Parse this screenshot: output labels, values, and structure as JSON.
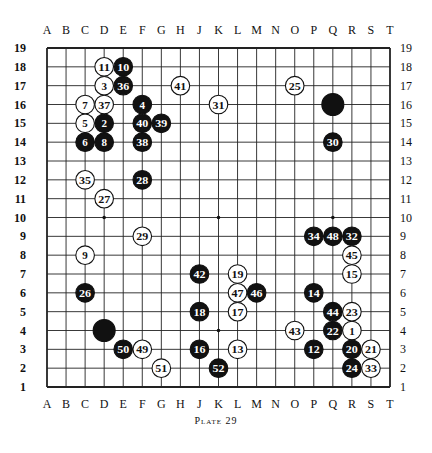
{
  "diagram": {
    "type": "go-board",
    "size": 19,
    "columns": [
      "A",
      "B",
      "C",
      "D",
      "E",
      "F",
      "G",
      "H",
      "J",
      "K",
      "L",
      "M",
      "N",
      "O",
      "P",
      "Q",
      "R",
      "S",
      "T"
    ],
    "rows": [
      19,
      18,
      17,
      16,
      15,
      14,
      13,
      12,
      11,
      10,
      9,
      8,
      7,
      6,
      5,
      4,
      3,
      2,
      1
    ],
    "hoshi": [
      "D4",
      "K4",
      "Q4",
      "D10",
      "K10",
      "Q10",
      "D16",
      "K16",
      "Q16"
    ],
    "caption": "Plate 29",
    "stones": [
      {
        "pt": "Q16",
        "color": "black",
        "label": ""
      },
      {
        "pt": "D4",
        "color": "black",
        "label": ""
      },
      {
        "pt": "R4",
        "color": "white",
        "label": "1"
      },
      {
        "pt": "D15",
        "color": "black",
        "label": "2"
      },
      {
        "pt": "D17",
        "color": "white",
        "label": "3"
      },
      {
        "pt": "F16",
        "color": "black",
        "label": "4"
      },
      {
        "pt": "C15",
        "color": "white",
        "label": "5"
      },
      {
        "pt": "C14",
        "color": "black",
        "label": "6"
      },
      {
        "pt": "C16",
        "color": "white",
        "label": "7"
      },
      {
        "pt": "D14",
        "color": "black",
        "label": "8"
      },
      {
        "pt": "C8",
        "color": "white",
        "label": "9"
      },
      {
        "pt": "E18",
        "color": "black",
        "label": "10"
      },
      {
        "pt": "D18",
        "color": "white",
        "label": "11"
      },
      {
        "pt": "P3",
        "color": "black",
        "label": "12"
      },
      {
        "pt": "L3",
        "color": "white",
        "label": "13"
      },
      {
        "pt": "P6",
        "color": "black",
        "label": "14"
      },
      {
        "pt": "R7",
        "color": "white",
        "label": "15"
      },
      {
        "pt": "J3",
        "color": "black",
        "label": "16"
      },
      {
        "pt": "L5",
        "color": "white",
        "label": "17"
      },
      {
        "pt": "J5",
        "color": "black",
        "label": "18"
      },
      {
        "pt": "L7",
        "color": "white",
        "label": "19"
      },
      {
        "pt": "R3",
        "color": "black",
        "label": "20"
      },
      {
        "pt": "S3",
        "color": "white",
        "label": "21"
      },
      {
        "pt": "Q4",
        "color": "black",
        "label": "22"
      },
      {
        "pt": "R5",
        "color": "white",
        "label": "23"
      },
      {
        "pt": "R2",
        "color": "black",
        "label": "24"
      },
      {
        "pt": "O17",
        "color": "white",
        "label": "25"
      },
      {
        "pt": "C6",
        "color": "black",
        "label": "26"
      },
      {
        "pt": "D11",
        "color": "white",
        "label": "27"
      },
      {
        "pt": "F12",
        "color": "black",
        "label": "28"
      },
      {
        "pt": "F9",
        "color": "white",
        "label": "29"
      },
      {
        "pt": "Q14",
        "color": "black",
        "label": "30"
      },
      {
        "pt": "K16",
        "color": "white",
        "label": "31"
      },
      {
        "pt": "R9",
        "color": "black",
        "label": "32"
      },
      {
        "pt": "S2",
        "color": "white",
        "label": "33"
      },
      {
        "pt": "P9",
        "color": "black",
        "label": "34"
      },
      {
        "pt": "C12",
        "color": "white",
        "label": "35"
      },
      {
        "pt": "E17",
        "color": "black",
        "label": "36"
      },
      {
        "pt": "D16",
        "color": "white",
        "label": "37"
      },
      {
        "pt": "F14",
        "color": "black",
        "label": "38"
      },
      {
        "pt": "G15",
        "color": "black",
        "label": "39"
      },
      {
        "pt": "F15",
        "color": "black",
        "label": "40"
      },
      {
        "pt": "H17",
        "color": "white",
        "label": "41"
      },
      {
        "pt": "J7",
        "color": "black",
        "label": "42"
      },
      {
        "pt": "O4",
        "color": "white",
        "label": "43"
      },
      {
        "pt": "Q5",
        "color": "black",
        "label": "44"
      },
      {
        "pt": "R8",
        "color": "white",
        "label": "45"
      },
      {
        "pt": "M6",
        "color": "black",
        "label": "46"
      },
      {
        "pt": "L6",
        "color": "white",
        "label": "47"
      },
      {
        "pt": "Q9",
        "color": "black",
        "label": "48"
      },
      {
        "pt": "F3",
        "color": "white",
        "label": "49"
      },
      {
        "pt": "E3",
        "color": "black",
        "label": "50"
      },
      {
        "pt": "G2",
        "color": "white",
        "label": "51"
      },
      {
        "pt": "K2",
        "color": "black",
        "label": "52"
      }
    ]
  }
}
